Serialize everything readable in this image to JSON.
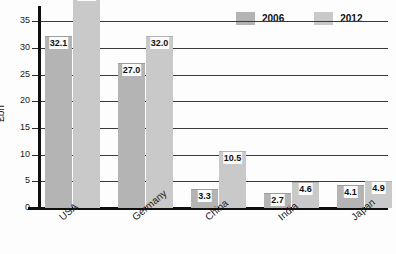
{
  "chart_data": {
    "type": "bar",
    "title": "",
    "xlabel": "",
    "ylabel": "£bn",
    "ylim": [
      0,
      37.5
    ],
    "yticks": [
      0,
      5,
      10,
      15,
      20,
      25,
      30,
      35
    ],
    "ytick_labels": [
      "0",
      "5",
      "10",
      "15",
      "20",
      "25",
      "30",
      "35"
    ],
    "grid": "horizontal",
    "legend_position": "top-right",
    "categories": [
      "USA",
      "Germany",
      "China",
      "India",
      "Japan"
    ],
    "series": [
      {
        "name": "2006",
        "color": "#b4b4b4",
        "values": [
          32.1,
          27.0,
          3.3,
          2.7,
          4.1
        ],
        "labels": [
          "32.1",
          "27.0",
          "3.3",
          "2.7",
          "4.1"
        ]
      },
      {
        "name": "2012",
        "color": "#c9c9c9",
        "values": [
          41.0,
          32.0,
          10.5,
          4.6,
          4.9
        ],
        "labels": [
          "41.0",
          "32.0",
          "10.5",
          "4.6",
          "4.9"
        ]
      }
    ]
  },
  "legend": {
    "items": [
      {
        "label": "2006",
        "color": "#b4b4b4"
      },
      {
        "label": "2012",
        "color": "#c9c9c9"
      }
    ]
  }
}
